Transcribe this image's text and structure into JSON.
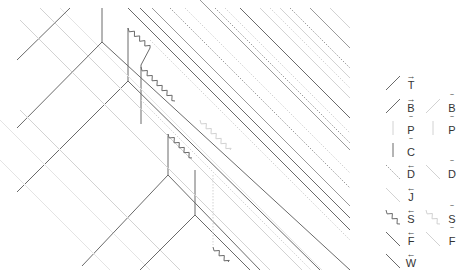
{
  "diagram": {
    "title": "",
    "colors": {
      "dark": "#6a6a6a",
      "mid": "#9a9a9a",
      "light": "#d2d2d2",
      "faint": "#e4e4e4"
    },
    "solid_lines": [
      {
        "pts": [
          [
            17,
            60
          ],
          [
            70,
            8
          ]
        ],
        "tone": "dark"
      },
      {
        "pts": [
          [
            102,
            8
          ],
          [
            102,
            42
          ]
        ],
        "tone": "dark"
      },
      {
        "pts": [
          [
            17,
            128
          ],
          [
            102,
            42
          ],
          [
            350,
            270
          ]
        ],
        "tone": "dark"
      },
      {
        "pts": [
          [
            128,
            28
          ],
          [
            128,
            81
          ]
        ],
        "tone": "dark"
      },
      {
        "pts": [
          [
            17,
            192
          ],
          [
            128,
            81
          ]
        ],
        "tone": "dark"
      },
      {
        "pts": [
          [
            128,
            81
          ],
          [
            320,
            270
          ]
        ],
        "tone": "dark"
      },
      {
        "pts": [
          [
            141,
            65
          ],
          [
            141,
            124
          ]
        ],
        "tone": "dark"
      },
      {
        "pts": [
          [
            150,
            48
          ],
          [
            141,
            65
          ]
        ],
        "tone": "dark"
      },
      {
        "pts": [
          [
            82,
            266
          ],
          [
            168,
            175
          ]
        ],
        "tone": "dark"
      },
      {
        "pts": [
          [
            168,
            134
          ],
          [
            168,
            175
          ],
          [
            260,
            270
          ]
        ],
        "tone": "dark"
      },
      {
        "pts": [
          [
            195,
            170
          ],
          [
            195,
            215
          ]
        ],
        "tone": "dark"
      },
      {
        "pts": [
          [
            140,
            270
          ],
          [
            195,
            215
          ],
          [
            250,
            270
          ]
        ],
        "tone": "dark"
      },
      {
        "pts": [
          [
            128,
            8
          ],
          [
            350,
            230
          ]
        ],
        "tone": "dark"
      },
      {
        "pts": [
          [
            140,
            8
          ],
          [
            350,
            218
          ]
        ],
        "tone": "dark"
      },
      {
        "pts": [
          [
            240,
            8
          ],
          [
            350,
            118
          ]
        ],
        "tone": "dark"
      },
      {
        "pts": [
          [
            200,
            0
          ],
          [
            350,
            150
          ]
        ],
        "tone": "mid"
      },
      {
        "pts": [
          [
            310,
            8
          ],
          [
            350,
            48
          ]
        ],
        "tone": "mid"
      },
      {
        "pts": [
          [
            152,
            8
          ],
          [
            350,
            206
          ]
        ],
        "tone": "mid"
      },
      {
        "pts": [
          [
            20,
            20
          ],
          [
            270,
            270
          ]
        ],
        "tone": "light"
      },
      {
        "pts": [
          [
            40,
            8
          ],
          [
            302,
            270
          ]
        ],
        "tone": "light"
      },
      {
        "pts": [
          [
            60,
            8
          ],
          [
            322,
            270
          ]
        ],
        "tone": "faint"
      },
      {
        "pts": [
          [
            0,
            120
          ],
          [
            150,
            270
          ]
        ],
        "tone": "faint"
      },
      {
        "pts": [
          [
            20,
            110
          ],
          [
            180,
            270
          ]
        ],
        "tone": "light"
      },
      {
        "pts": [
          [
            0,
            160
          ],
          [
            110,
            270
          ]
        ],
        "tone": "faint"
      },
      {
        "pts": [
          [
            260,
            8
          ],
          [
            350,
            98
          ]
        ],
        "tone": "light"
      },
      {
        "pts": [
          [
            280,
            8
          ],
          [
            350,
            78
          ]
        ],
        "tone": "light"
      },
      {
        "pts": [
          [
            330,
            8
          ],
          [
            350,
            28
          ]
        ],
        "tone": "light"
      }
    ],
    "dotted_lines": [
      {
        "pts": [
          [
            170,
            8
          ],
          [
            350,
            188
          ]
        ],
        "tone": "mid"
      },
      {
        "pts": [
          [
            185,
            8
          ],
          [
            350,
            173
          ]
        ],
        "tone": "light"
      },
      {
        "pts": [
          [
            215,
            8
          ],
          [
            350,
            143
          ]
        ],
        "tone": "mid"
      },
      {
        "pts": [
          [
            225,
            8
          ],
          [
            350,
            133
          ]
        ],
        "tone": "light"
      },
      {
        "pts": [
          [
            270,
            8
          ],
          [
            350,
            88
          ]
        ],
        "tone": "light"
      },
      {
        "pts": [
          [
            290,
            8
          ],
          [
            350,
            68
          ]
        ],
        "tone": "mid"
      },
      {
        "pts": [
          [
            213,
            175
          ],
          [
            213,
            245
          ]
        ],
        "tone": "light"
      },
      {
        "pts": [
          [
            150,
            40
          ],
          [
            350,
            240
          ]
        ],
        "tone": "light"
      },
      {
        "pts": [
          [
            141,
            100
          ],
          [
            311,
            270
          ]
        ],
        "tone": "light"
      }
    ],
    "zigzags": [
      {
        "from": [
          128,
          28
        ],
        "to": [
          150,
          48
        ],
        "tone": "dark"
      },
      {
        "from": [
          141,
          67
        ],
        "to": [
          175,
          101
        ],
        "tone": "dark"
      },
      {
        "from": [
          168,
          134
        ],
        "to": [
          192,
          158
        ],
        "tone": "dark"
      },
      {
        "from": [
          213,
          247
        ],
        "to": [
          228,
          262
        ],
        "tone": "dark"
      },
      {
        "from": [
          200,
          120
        ],
        "to": [
          230,
          150
        ],
        "tone": "light"
      }
    ],
    "legend": {
      "rows": [
        {
          "y": 88,
          "left": {
            "style": "solid-up",
            "tone": "dark",
            "label": "T",
            "accent": "→"
          }
        },
        {
          "y": 111,
          "left": {
            "style": "solid-up",
            "tone": "dark",
            "label": "B",
            "accent": "→"
          },
          "right": {
            "style": "solid-up",
            "tone": "light",
            "label": "B",
            "accent": "‾"
          }
        },
        {
          "y": 133,
          "left": {
            "style": "vertical",
            "tone": "light",
            "label": "P",
            "accent": "‾"
          },
          "right": {
            "style": "vertical",
            "tone": "light",
            "label": "P",
            "accent": "‾"
          }
        },
        {
          "y": 155,
          "left": {
            "style": "vertical",
            "tone": "dark",
            "label": "C",
            "accent": "‾"
          }
        },
        {
          "y": 177,
          "left": {
            "style": "dotted-down",
            "tone": "mid",
            "label": "D",
            "accent": "←"
          },
          "right": {
            "style": "solid-down",
            "tone": "light",
            "label": "D",
            "accent": "‾"
          }
        },
        {
          "y": 200,
          "left": {
            "style": "solid-down",
            "tone": "light",
            "label": "J",
            "accent": "←"
          }
        },
        {
          "y": 222,
          "left": {
            "style": "zigzag-down",
            "tone": "dark",
            "label": "S",
            "accent": "←"
          },
          "right": {
            "style": "zigzag-down",
            "tone": "light",
            "label": "S",
            "accent": "‾"
          }
        },
        {
          "y": 244,
          "left": {
            "style": "solid-down",
            "tone": "dark",
            "label": "F",
            "accent": "←"
          },
          "right": {
            "style": "solid-down",
            "tone": "light",
            "label": "F",
            "accent": "‾"
          }
        },
        {
          "y": 266,
          "left": {
            "style": "solid-down",
            "tone": "dark",
            "label": "W",
            "accent": "←"
          }
        }
      ],
      "left_symbol_x": 386,
      "left_label_x": 405,
      "right_symbol_x": 426,
      "right_label_x": 446
    }
  }
}
